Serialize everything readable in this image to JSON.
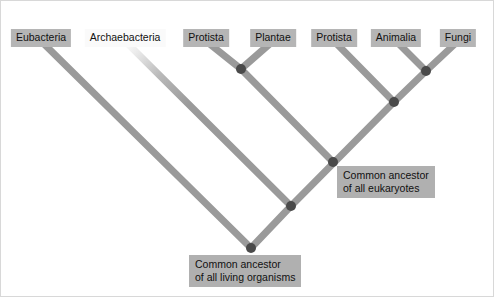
{
  "figure": {
    "type": "phylogenetic-tree",
    "background_color": "#ffffff",
    "branch_color": "#9a9a9a",
    "node_color": "#4a4a4a",
    "label_background": "#b5b5b5",
    "label_background_light": "#fafafa"
  },
  "taxa": [
    {
      "id": "eubacteria",
      "label": "Eubacteria",
      "x": 40,
      "y": 28,
      "style": "gray"
    },
    {
      "id": "archaebacteria",
      "label": "Archaebacteria",
      "x": 124,
      "y": 28,
      "style": "light"
    },
    {
      "id": "protista_left",
      "label": "Protista",
      "x": 205,
      "y": 28,
      "style": "gray"
    },
    {
      "id": "plantae",
      "label": "Plantae",
      "x": 272,
      "y": 28,
      "style": "gray"
    },
    {
      "id": "protista_right",
      "label": "Protista",
      "x": 333,
      "y": 28,
      "style": "gray"
    },
    {
      "id": "animalia",
      "label": "Animalia",
      "x": 395,
      "y": 28,
      "style": "gray"
    },
    {
      "id": "fungi",
      "label": "Fungi",
      "x": 457,
      "y": 28,
      "style": "gray"
    }
  ],
  "ancestors": [
    {
      "id": "eukaryote-ancestor",
      "line1": "Common ancestor",
      "line2": "of all eukaryotes",
      "x": 336,
      "y": 165
    },
    {
      "id": "universal-ancestor",
      "line1": "Common ancestor",
      "line2": "of all living organisms",
      "x": 188,
      "y": 254
    }
  ],
  "nodes": [
    {
      "id": "node-plant-protist",
      "x": 240,
      "y": 68,
      "radius": 5
    },
    {
      "id": "node-animalia-fungi",
      "x": 425,
      "y": 70,
      "radius": 5
    },
    {
      "id": "node-opisthokont",
      "x": 393,
      "y": 101,
      "radius": 5
    },
    {
      "id": "node-eukaryote",
      "x": 332,
      "y": 161,
      "radius": 5
    },
    {
      "id": "node-archaeal-split",
      "x": 290,
      "y": 205,
      "radius": 5
    },
    {
      "id": "node-root",
      "x": 250,
      "y": 247,
      "radius": 5
    }
  ],
  "branches": [
    {
      "id": "branch-eubacteria",
      "x1": 40,
      "y1": 40,
      "x2": 250,
      "y2": 247,
      "fade": false
    },
    {
      "id": "branch-archaebacteria",
      "x1": 124,
      "y1": 40,
      "x2": 290,
      "y2": 205,
      "fade": true
    },
    {
      "id": "branch-protista-left",
      "x1": 205,
      "y1": 40,
      "x2": 240,
      "y2": 68,
      "fade": false
    },
    {
      "id": "branch-plantae",
      "x1": 272,
      "y1": 40,
      "x2": 240,
      "y2": 68,
      "fade": false
    },
    {
      "id": "branch-plant-clade-stem",
      "x1": 240,
      "y1": 68,
      "x2": 332,
      "y2": 161,
      "fade": false
    },
    {
      "id": "branch-protista-right",
      "x1": 333,
      "y1": 40,
      "x2": 393,
      "y2": 101,
      "fade": false
    },
    {
      "id": "branch-animalia",
      "x1": 395,
      "y1": 40,
      "x2": 425,
      "y2": 70,
      "fade": false
    },
    {
      "id": "branch-fungi",
      "x1": 457,
      "y1": 40,
      "x2": 425,
      "y2": 70,
      "fade": false
    },
    {
      "id": "branch-opisthokont-stem",
      "x1": 425,
      "y1": 70,
      "x2": 393,
      "y2": 101,
      "fade": false
    },
    {
      "id": "branch-eukaryote-stem",
      "x1": 393,
      "y1": 101,
      "x2": 290,
      "y2": 205,
      "fade": false
    },
    {
      "id": "branch-root-right",
      "x1": 290,
      "y1": 205,
      "x2": 250,
      "y2": 247,
      "fade": false
    }
  ]
}
